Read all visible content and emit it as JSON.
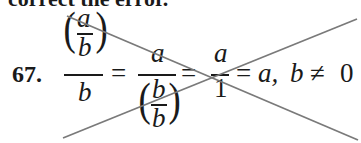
{
  "header": {
    "text": "correct the error."
  },
  "exercise": {
    "number": "67.",
    "lhs": {
      "inner_num": "a",
      "inner_den": "b",
      "outer_den": "b"
    },
    "eq1": "=",
    "mid": {
      "num": "a",
      "inner_num": "b",
      "inner_den": "b"
    },
    "eq2": "=",
    "third": {
      "num": "a",
      "den": "1"
    },
    "eq3": "=",
    "result": "a,",
    "condition_var": "b",
    "condition_op": "≠",
    "condition_val": "0"
  },
  "strike": {
    "color": "#7a7a7a",
    "meaning": "crossed-out (incorrect)"
  }
}
